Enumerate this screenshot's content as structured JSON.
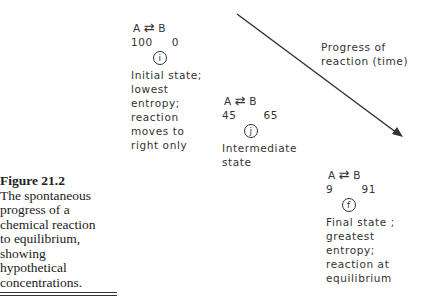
{
  "caption": {
    "figure_label": "Figure 21.2",
    "lines": [
      "The spontaneous",
      "progress of a",
      "chemical reaction",
      "to equilibrium,",
      "showing",
      "hypothetical",
      "concentrations."
    ]
  },
  "axis_label": {
    "line1": "Progress of",
    "line2": "reaction (time)"
  },
  "states": [
    {
      "reactant": "A",
      "product": "B",
      "arrow": "⇄",
      "a_value": "100",
      "b_value": "0",
      "marker": "i",
      "description": [
        "Initial state;",
        "lowest",
        "entropy;",
        "reaction",
        "moves to",
        "right only"
      ]
    },
    {
      "reactant": "A",
      "product": "B",
      "arrow": "⇄",
      "a_value": "45",
      "b_value": "65",
      "marker": "j",
      "description": [
        "Intermediate",
        "state"
      ]
    },
    {
      "reactant": "A",
      "product": "B",
      "arrow": "⇄",
      "a_value": "9",
      "b_value": "91",
      "marker": "f",
      "description": [
        "Final state ;",
        "greatest",
        "entropy;",
        "reaction at",
        "equilibrium"
      ]
    }
  ],
  "colors": {
    "ink": "#333333",
    "background": "#ffffff"
  }
}
